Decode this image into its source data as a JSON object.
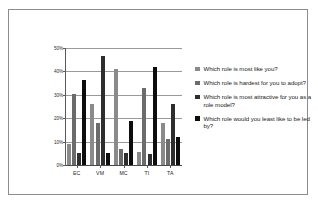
{
  "chart_data": {
    "type": "bar",
    "title": "",
    "xlabel": "",
    "ylabel": "",
    "categories": [
      "EC",
      "VM",
      "MC",
      "TI",
      "TA"
    ],
    "ylim": [
      0,
      50
    ],
    "ytick_labels": [
      "0%",
      "10%",
      "20%",
      "30%",
      "40%",
      "50%"
    ],
    "ytick_values": [
      0,
      10,
      20,
      30,
      40,
      50
    ],
    "grid": true,
    "legend_position": "right",
    "series": [
      {
        "name": "Which role is most like you?",
        "color": "#8a8a8a",
        "values": [
          9,
          26,
          41,
          5.5,
          18
        ]
      },
      {
        "name": "Which role is hardest for you to adopt?",
        "color": "#6b6b6b",
        "values": [
          30.5,
          18,
          7,
          33,
          11
        ]
      },
      {
        "name": "Which role is most attractive for you as a role model?",
        "color": "#2e2e2e",
        "values": [
          5,
          46.5,
          5,
          4.5,
          26
        ]
      },
      {
        "name": "Which role would you least like to be led by?",
        "color": "#0d0d0d",
        "values": [
          36.5,
          5,
          19,
          42,
          12
        ]
      }
    ]
  },
  "legend": {
    "items": [
      {
        "label": "Which role is most like you?"
      },
      {
        "label": "Which role is hardest for you to adopt?"
      },
      {
        "label": "Which role is most attractive for you as a role model?"
      },
      {
        "label": "Which role would you least like to be led by?"
      }
    ]
  }
}
